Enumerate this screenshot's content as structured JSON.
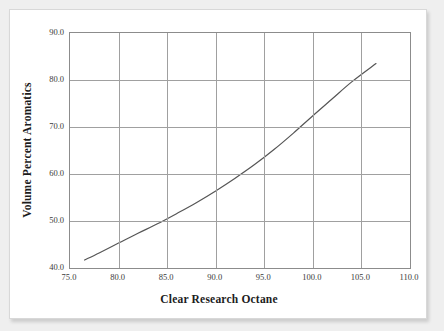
{
  "figure": {
    "background": "#ffffff",
    "page_background": "#efefef",
    "frame_color": "#8c8c8c",
    "grid_color": "#a0a0a0",
    "curve_color": "#555555"
  },
  "chart_data": {
    "type": "line",
    "title": "",
    "xlabel": "Clear Research Octane",
    "ylabel": "Volume Percent Aromatics",
    "xlim": [
      75.0,
      110.0
    ],
    "ylim": [
      40.0,
      90.0
    ],
    "xticks": [
      "75.0",
      "80.0",
      "85.0",
      "90.0",
      "95.0",
      "100.0",
      "105.0",
      "110.0"
    ],
    "yticks": [
      "40.0",
      "50.0",
      "60.0",
      "70.0",
      "80.0",
      "90.0"
    ],
    "xtick_values": [
      75.0,
      80.0,
      85.0,
      90.0,
      95.0,
      100.0,
      105.0,
      110.0
    ],
    "ytick_values": [
      40.0,
      50.0,
      60.0,
      70.0,
      80.0,
      90.0
    ],
    "grid": true,
    "legend": false,
    "series": [
      {
        "name": "Volume Percent Aromatics vs Clear Research Octane",
        "x": [
          76.5,
          78.0,
          80.0,
          82.0,
          84.0,
          86.0,
          88.0,
          90.0,
          92.0,
          94.0,
          96.0,
          98.0,
          100.0,
          102.0,
          104.0,
          106.5
        ],
        "y": [
          41.7,
          43.2,
          45.3,
          47.4,
          49.4,
          51.6,
          53.9,
          56.4,
          59.1,
          62.0,
          65.2,
          68.7,
          72.4,
          76.0,
          79.6,
          83.5
        ]
      }
    ]
  }
}
